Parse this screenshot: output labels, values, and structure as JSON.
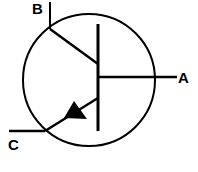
{
  "diagram": {
    "labels": {
      "b": "B",
      "a": "A",
      "c": "C"
    },
    "colors": {
      "stroke": "#000000",
      "background": "#ffffff"
    }
  }
}
